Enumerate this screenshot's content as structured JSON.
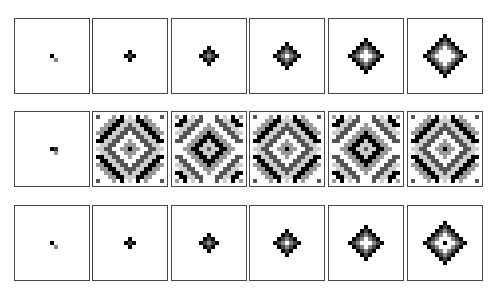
{
  "figure": {
    "grid_size": 17,
    "colors": {
      "border": "#444444",
      "black": "#000000",
      "dark": "#333333",
      "mid": "#777777",
      "light": "#aaaaaa",
      "white": "#ffffff"
    },
    "panel_x": [
      14,
      92,
      171,
      249,
      328,
      407
    ],
    "rows": [
      {
        "y": 18,
        "panels": [
          {
            "type": "seed",
            "cells": [
              [
                8,
                8,
                "#000000"
              ],
              [
                9,
                9,
                "#888888"
              ]
            ]
          },
          {
            "type": "diamond",
            "radius": 1,
            "hollow": -1
          },
          {
            "type": "diamond",
            "radius": 2,
            "hollow": -1
          },
          {
            "type": "diamond",
            "radius": 3,
            "hollow": 0
          },
          {
            "type": "diamond",
            "radius": 4,
            "hollow": 1
          },
          {
            "type": "diamond",
            "radius": 5,
            "hollow": 2
          }
        ]
      },
      {
        "y": 111,
        "panels": [
          {
            "type": "seed",
            "cells": [
              [
                8,
                8,
                "#000000"
              ],
              [
                8,
                9,
                "#333333"
              ],
              [
                9,
                9,
                "#999999"
              ]
            ]
          },
          {
            "type": "full",
            "phase": 0
          },
          {
            "type": "full",
            "phase": 1
          },
          {
            "type": "full",
            "phase": 0
          },
          {
            "type": "full",
            "phase": 1
          },
          {
            "type": "full",
            "phase": 0
          }
        ]
      },
      {
        "y": 205,
        "panels": [
          {
            "type": "seed",
            "cells": [
              [
                8,
                8,
                "#000000"
              ],
              [
                9,
                9,
                "#888888"
              ]
            ]
          },
          {
            "type": "diamond",
            "radius": 1,
            "hollow": -1
          },
          {
            "type": "diamond",
            "radius": 2,
            "hollow": -1
          },
          {
            "type": "diamond",
            "radius": 3,
            "hollow": 0
          },
          {
            "type": "diamond",
            "radius": 4,
            "hollow": 1
          },
          {
            "type": "diamond",
            "radius": 5,
            "hollow": 2,
            "center_dot": true
          }
        ]
      }
    ]
  }
}
